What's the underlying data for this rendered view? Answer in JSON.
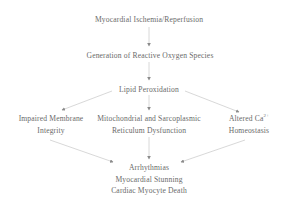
{
  "diagram": {
    "type": "flowchart",
    "colors": {
      "text": "#6a6a6a",
      "edge": "#d4d4d4",
      "arrowhead": "#8a8a8a",
      "background": "#ffffff"
    },
    "nodes": {
      "ischemia": {
        "lines": [
          "Myocardial Ischemia/Reperfusion"
        ]
      },
      "ros": {
        "lines": [
          "Generation of Reactive Oxygen Species"
        ]
      },
      "lipid": {
        "lines": [
          "Lipid Peroxidation"
        ]
      },
      "membrane": {
        "lines": [
          "Impaired Membrane",
          "Integrity"
        ]
      },
      "mito": {
        "lines": [
          "Mitochondrial and Sarcoplasmic",
          "Reticulum Dysfunction"
        ]
      },
      "calcium": {
        "line1_prefix": "Altered Ca",
        "line1_sup": "2+",
        "lines": [
          "Altered Ca2+",
          "Homeostasis"
        ],
        "line2": "Homeostasis"
      },
      "outcome": {
        "lines": [
          "Arrhythmias",
          "Myocardial Stunning",
          "Cardiac Myocyte Death"
        ]
      }
    },
    "edges": [
      {
        "from": "ischemia",
        "to": "ros"
      },
      {
        "from": "ros",
        "to": "lipid"
      },
      {
        "from": "lipid",
        "to": "membrane"
      },
      {
        "from": "lipid",
        "to": "mito"
      },
      {
        "from": "lipid",
        "to": "calcium"
      },
      {
        "from": "membrane",
        "to": "outcome"
      },
      {
        "from": "mito",
        "to": "outcome"
      },
      {
        "from": "calcium",
        "to": "outcome"
      }
    ]
  }
}
